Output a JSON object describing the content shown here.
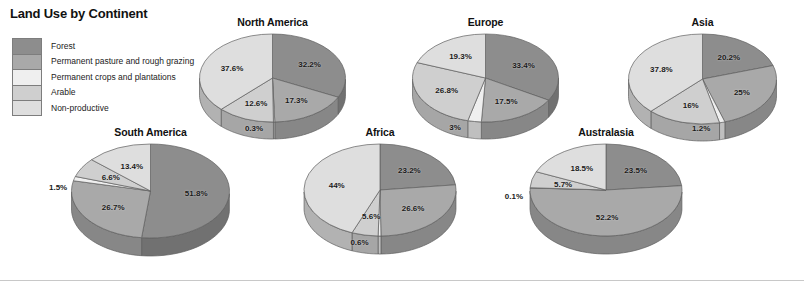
{
  "title": "Land Use by Continent",
  "legend": {
    "items": [
      {
        "label": "Forest",
        "color": "#8d8d8d"
      },
      {
        "label": "Permanent pasture and rough grazing",
        "color": "#a9a9a9"
      },
      {
        "label": "Permanent crops and plantations",
        "color": "#efefef"
      },
      {
        "label": "Arable",
        "color": "#cfcfcf"
      },
      {
        "label": "Non-productive",
        "color": "#dedede"
      }
    ]
  },
  "chart_data": {
    "type": "pie",
    "title": "Land Use by Continent",
    "units": "percent",
    "categories": [
      "Forest",
      "Permanent pasture and rough grazing",
      "Permanent crops and plantations",
      "Arable",
      "Non-productive"
    ],
    "colors": [
      "#8d8d8d",
      "#a9a9a9",
      "#efefef",
      "#cfcfcf",
      "#dedede"
    ],
    "charts": [
      {
        "name": "North America",
        "values": [
          32.2,
          17.3,
          0.3,
          12.6,
          37.6
        ],
        "labels": [
          "32.2%",
          "17.3%",
          "0.3%",
          "12.6%",
          "37.6%"
        ]
      },
      {
        "name": "Europe",
        "values": [
          33.4,
          17.5,
          3,
          26.8,
          19.3
        ],
        "labels": [
          "33.4%",
          "17.5%",
          "3%",
          "26.8%",
          "19.3%"
        ]
      },
      {
        "name": "Asia",
        "values": [
          20.2,
          25,
          1.2,
          16,
          37.8
        ],
        "labels": [
          "20.2%",
          "25%",
          "1.2%",
          "16%",
          "37.8%"
        ]
      },
      {
        "name": "South America",
        "values": [
          51.8,
          26.7,
          1.5,
          6.6,
          13.4
        ],
        "labels": [
          "51.8%",
          "26.7%",
          "1.5%",
          "6.6%",
          "13.4%"
        ]
      },
      {
        "name": "Africa",
        "values": [
          23.2,
          26.6,
          0.6,
          5.6,
          44
        ],
        "labels": [
          "23.2%",
          "26.6%",
          "0.6%",
          "5.6%",
          "44%"
        ]
      },
      {
        "name": "Australasia",
        "values": [
          23.5,
          52.2,
          0.1,
          5.7,
          18.5
        ],
        "labels": [
          "23.5%",
          "52.2%",
          "0.1%",
          "5.7%",
          "18.5%"
        ]
      }
    ]
  },
  "layout": {
    "charts": [
      {
        "left": 185,
        "top": 16,
        "width": 175,
        "rx": 73,
        "ry": 44,
        "depth": 17,
        "labelRadius": 0.6
      },
      {
        "left": 398,
        "top": 16,
        "width": 175,
        "rx": 73,
        "ry": 44,
        "depth": 17,
        "labelRadius": 0.6
      },
      {
        "left": 615,
        "top": 16,
        "width": 175,
        "rx": 74,
        "ry": 45,
        "depth": 17,
        "labelRadius": 0.6
      },
      {
        "left": 58,
        "top": 126,
        "width": 185,
        "rx": 79,
        "ry": 47,
        "depth": 18,
        "labelRadius": 0.58
      },
      {
        "left": 290,
        "top": 126,
        "width": 180,
        "rx": 76,
        "ry": 46,
        "depth": 18,
        "labelRadius": 0.58
      },
      {
        "left": 516,
        "top": 126,
        "width": 180,
        "rx": 76,
        "ry": 46,
        "depth": 18,
        "labelRadius": 0.58
      }
    ],
    "startAngleDeg": -90
  }
}
